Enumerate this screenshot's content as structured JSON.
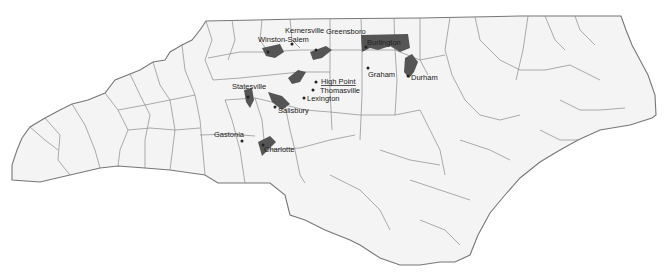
{
  "map": {
    "region": "North Carolina",
    "description": "County outline map with shaded urbanized areas along the I-85/I-40 Piedmont corridor",
    "colors": {
      "background": "#ffffff",
      "land": "#f4f4f4",
      "county_lines": "#8a8a8a",
      "urban_areas": "#555555",
      "labels": "#222222"
    },
    "cities": [
      {
        "name": "Kernersville",
        "x": 285,
        "y": 33
      },
      {
        "name": "Winston-Salem",
        "x": 258,
        "y": 42
      },
      {
        "name": "Greensboro",
        "x": 326,
        "y": 34
      },
      {
        "name": "Burlington",
        "x": 367,
        "y": 45
      },
      {
        "name": "Graham",
        "x": 368,
        "y": 77
      },
      {
        "name": "Durham",
        "x": 411,
        "y": 80
      },
      {
        "name": "High Point",
        "x": 321,
        "y": 84
      },
      {
        "name": "Thomasville",
        "x": 320,
        "y": 93
      },
      {
        "name": "Statesville",
        "x": 232,
        "y": 89
      },
      {
        "name": "Lexington",
        "x": 307,
        "y": 101
      },
      {
        "name": "Salisbury",
        "x": 278,
        "y": 113
      },
      {
        "name": "Gastonia",
        "x": 214,
        "y": 137
      },
      {
        "name": "Charlotte",
        "x": 264,
        "y": 152
      }
    ]
  }
}
